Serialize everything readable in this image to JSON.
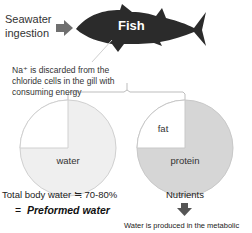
{
  "diagram": {
    "fish": {
      "label": "Fish",
      "color": "#2b2b2b"
    },
    "intake": {
      "label_line1": "Seawater",
      "label_line2": "ingestion",
      "arrow_color": "#6f6f6f"
    },
    "note": {
      "line1": "Na⁺ is discarded from the",
      "line2": "chloride cells in the gill with",
      "line3": "consuming energy"
    },
    "left_pie": {
      "segments": [
        {
          "label": "",
          "fraction": 0.25,
          "color": "#ffffff"
        },
        {
          "label": "water",
          "fraction": 0.75,
          "color": "#efefef"
        }
      ],
      "caption": "Total body water ≒ 70-80%",
      "equals_prefix": "=",
      "equals_label": "Preformed water"
    },
    "right_pie": {
      "segments": [
        {
          "label": "fat",
          "fraction": 0.25,
          "color": "#ffffff"
        },
        {
          "label": "protein",
          "fraction": 0.75,
          "color": "#d6d6d6"
        }
      ],
      "caption": "Nutrients",
      "arrow_color": "#555555",
      "result": "Water is produced in the metabolic"
    }
  }
}
